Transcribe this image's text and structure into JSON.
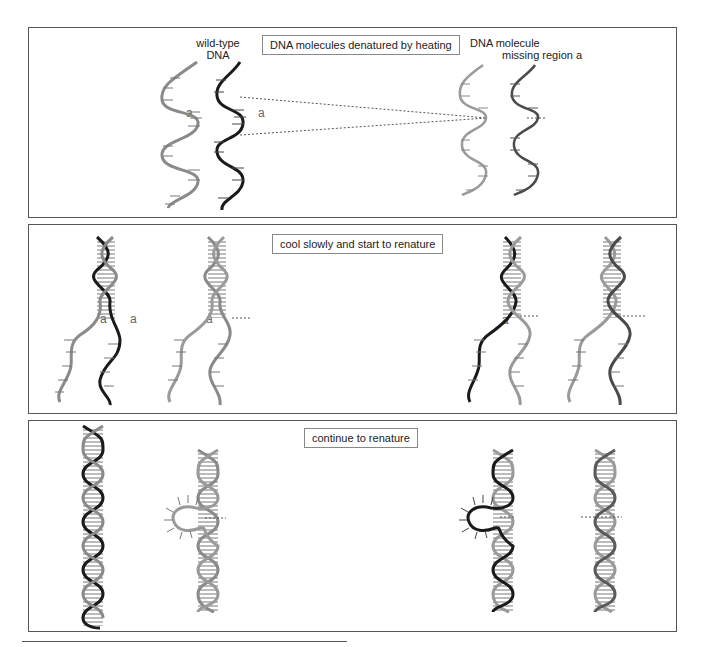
{
  "figure": {
    "colors": {
      "wild_type_strand_dark": "#1a1a1a",
      "wild_type_strand_light": "#8a8a8a",
      "mutant_strand_dark": "#4a4a4a",
      "mutant_strand_light": "#9a9a9a",
      "dotted_line": "#555555",
      "panel_border": "#555555"
    },
    "panels": [
      {
        "id": "panel-1",
        "caption": "DNA molecules denatured by heating",
        "labels": {
          "wild_type_line1": "wild-type",
          "wild_type_line2": "DNA",
          "mutant_line1": "DNA molecule",
          "mutant_line2": "missing region a"
        },
        "region_labels": [
          "a",
          "a"
        ]
      },
      {
        "id": "panel-2",
        "caption": "cool slowly and start to renature",
        "region_labels": [
          "a",
          "a",
          "a",
          "a"
        ]
      },
      {
        "id": "panel-3",
        "caption": "continue to renature"
      }
    ]
  }
}
